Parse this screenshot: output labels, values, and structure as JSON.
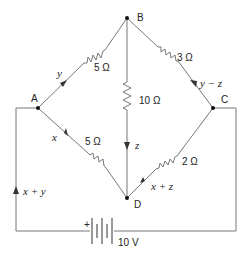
{
  "nodes": {
    "A": "A",
    "B": "B",
    "C": "C",
    "D": "D"
  },
  "resistors": {
    "AB": "5 Ω",
    "BC": "3 Ω",
    "BD": "10 Ω",
    "AD": "5 Ω",
    "DC": "2 Ω"
  },
  "currents": {
    "AB": "y",
    "BC": "y − z",
    "BD": "z",
    "AD": "x",
    "DC": "x + z",
    "source": "x + y"
  },
  "battery": {
    "voltage": "10 V",
    "polarity": "+"
  }
}
